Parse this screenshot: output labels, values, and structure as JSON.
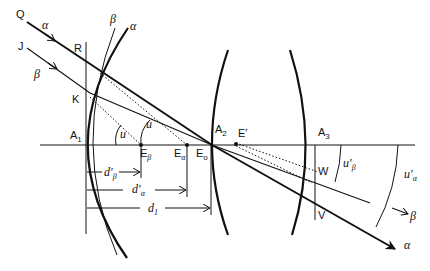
{
  "diagram": {
    "type": "optical ray diagram",
    "colors": {
      "ink": "#111111",
      "background": "#ffffff"
    },
    "labels": {
      "Q": "Q",
      "J": "J",
      "R": "R",
      "K": "K",
      "W": "W",
      "V": "V",
      "A1": "A",
      "A1_sub": "1",
      "A2": "A",
      "A2_sub": "2",
      "A3": "A",
      "A3_sub": "3",
      "E_beta": "E",
      "E_beta_sub": "β",
      "E_alpha": "E",
      "E_alpha_sub": "α",
      "E_o": "E",
      "E_o_sub": "o",
      "E_prime": "E′",
      "u1": "u",
      "u2": "u",
      "alpha_ray_in": "α",
      "beta_ray_in": "β",
      "beta_surface": "β",
      "alpha_surface": "α",
      "alpha_ray_out": "α",
      "beta_ray_out": "β",
      "u_prime_beta": "u′",
      "u_prime_beta_sub": "β",
      "u_prime_alpha": "u′",
      "u_prime_alpha_sub": "α",
      "d_prime_beta": "d′",
      "d_prime_beta_sub": "β",
      "d_prime_alpha": "d′",
      "d_prime_alpha_sub": "α",
      "d1": "d",
      "d1_sub": "1"
    }
  }
}
